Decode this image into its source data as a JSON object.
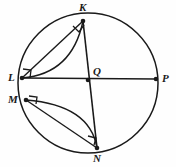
{
  "figure": {
    "background_color": "#fefefe",
    "stroke_color": "#1a1a1a",
    "width": 176,
    "height": 167
  },
  "circle": {
    "name": "main-circle",
    "center": {
      "x": 88,
      "y": 83
    },
    "radius_x": 70,
    "radius_y": 70
  },
  "points": [
    {
      "id": "K",
      "label": "K",
      "x": 83,
      "y": 21,
      "label_x": 79,
      "label_y": 2,
      "marked": true
    },
    {
      "id": "L",
      "label": "L",
      "x": 22,
      "y": 78,
      "label_x": 8,
      "label_y": 72,
      "marked": true
    },
    {
      "id": "M",
      "label": "M",
      "x": 26,
      "y": 100,
      "label_x": 8,
      "label_y": 94,
      "marked": true
    },
    {
      "id": "N",
      "label": "N",
      "x": 97,
      "y": 148,
      "label_x": 93,
      "label_y": 153,
      "marked": true
    },
    {
      "id": "P",
      "label": "P",
      "x": 156,
      "y": 79,
      "label_x": 162,
      "label_y": 73,
      "marked": true
    },
    {
      "id": "Q",
      "label": "Q",
      "x": 88,
      "y": 80,
      "label_x": 93,
      "label_y": 66,
      "marked": true
    }
  ],
  "segments": [
    {
      "id": "LP",
      "from": "L",
      "to": "P",
      "label": "chord L to P through Q"
    },
    {
      "id": "KN",
      "from": "K",
      "to": "N",
      "label": "chord K to N through Q"
    },
    {
      "id": "LK",
      "from": "L",
      "to": "K",
      "label": "chord L to K"
    },
    {
      "id": "MN",
      "from": "M",
      "to": "N",
      "label": "chord M to N"
    }
  ],
  "arcs": [
    {
      "id": "arc-LK",
      "from": "L",
      "to": "K",
      "label": "arc bulging from L to K"
    },
    {
      "id": "arc-MN",
      "from": "M",
      "to": "N",
      "label": "arc bulging from M to N"
    }
  ],
  "right_angles": [
    {
      "id": "angle-K",
      "at": "K",
      "label": "right angle at K"
    },
    {
      "id": "angle-L",
      "at": "L",
      "label": "right angle at L"
    },
    {
      "id": "angle-M",
      "at": "M",
      "label": "right angle at M"
    },
    {
      "id": "angle-N",
      "at": "N",
      "label": "right angle at N"
    }
  ]
}
